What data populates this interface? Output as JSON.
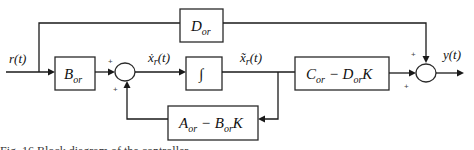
{
  "diagram": {
    "type": "block-diagram",
    "signals": {
      "input": "r(t)",
      "state_derivative": "ẋ",
      "state_derivative_sub": "r",
      "state_derivative_arg": "(t)",
      "state": "x̃",
      "state_sub": "r",
      "state_arg": "(t)",
      "output": "y(t)"
    },
    "blocks": {
      "d_block": {
        "main": "D",
        "sub": "or"
      },
      "b_block": {
        "main": "B",
        "sub": "or"
      },
      "integrator": {
        "symbol": "∫"
      },
      "c_block": {
        "main1": "C",
        "sub1": "or",
        "op": " − ",
        "main2": "D",
        "sub2": "or",
        "tail": "K"
      },
      "a_block": {
        "main1": "A",
        "sub1": "or",
        "op": " − ",
        "main2": "B",
        "sub2": "or",
        "tail": "K"
      }
    },
    "summing_junctions": {
      "sum1": {
        "signs": [
          "+",
          "+"
        ]
      },
      "sum2": {
        "signs": [
          "+",
          "+"
        ]
      }
    },
    "caption": "Fig. 16 Block diagram of the controller"
  }
}
